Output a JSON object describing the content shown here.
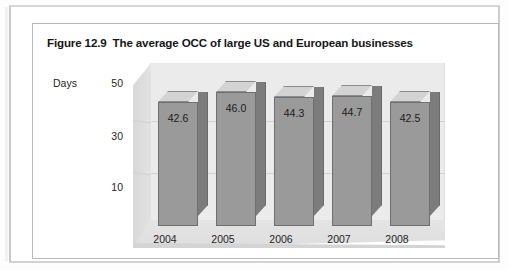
{
  "figure": {
    "number": "Figure 12.9",
    "title": "The average OCC of large US and European businesses"
  },
  "chart_data": {
    "type": "bar",
    "categories": [
      "2004",
      "2005",
      "2006",
      "2007",
      "2008"
    ],
    "values": [
      42.6,
      46.0,
      44.3,
      44.7,
      42.5
    ],
    "data_labels": [
      "42.6",
      "46.0",
      "44.3",
      "44.7",
      "42.5"
    ],
    "xlabel": "",
    "ylabel": "Days",
    "ytick_labels": [
      "50",
      "30",
      "10"
    ],
    "ytick_values": [
      50,
      30,
      10
    ],
    "ylim": [
      0,
      56
    ],
    "grid": true,
    "legend": "none",
    "style": "3d-column",
    "colors": {
      "bar_front": "#9a9a9a",
      "bar_top": "#d3d3d3",
      "bar_side": "#7c7c7c",
      "wall": "#ebebeb",
      "floor": "#e2e2e2",
      "gridline": "#d3d3d3",
      "text": "#1a1a1a",
      "frame": "#b9b9b9"
    }
  }
}
